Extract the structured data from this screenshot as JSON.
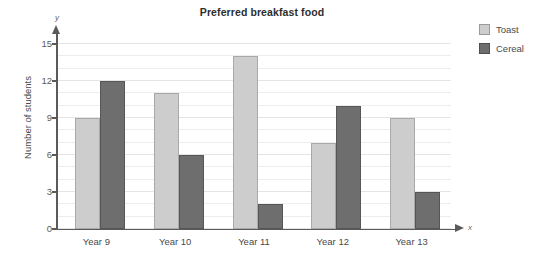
{
  "chart_data": {
    "type": "bar",
    "title": "Preferred breakfast food",
    "xlabel": "",
    "ylabel": "Number of students",
    "categories": [
      "Year 9",
      "Year 10",
      "Year 11",
      "Year 12",
      "Year 13"
    ],
    "series": [
      {
        "name": "Toast",
        "color": "#cdcdcd",
        "values": [
          9,
          11,
          14,
          7,
          9
        ]
      },
      {
        "name": "Cereal",
        "color": "#6e6e6e",
        "values": [
          12,
          6,
          2,
          10,
          3
        ]
      }
    ],
    "ylim": [
      0,
      15
    ],
    "y_ticks": [
      0,
      3,
      6,
      9,
      12,
      15
    ],
    "y_tick_labels": [
      "0",
      "3",
      "6",
      "9",
      "12",
      "15"
    ],
    "minor_gridline_step": 1,
    "grid": true,
    "legend_position": "top-right",
    "axis_letters": {
      "y": "y",
      "x": "x"
    }
  },
  "legend": {
    "items": [
      {
        "label": "Toast"
      },
      {
        "label": "Cereal"
      }
    ]
  }
}
